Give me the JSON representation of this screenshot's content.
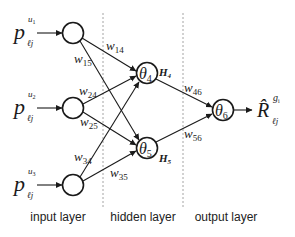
{
  "diagram": {
    "type": "neural-network",
    "inputs": [
      {
        "id": "input-1",
        "symbol": "p",
        "superscript": "u",
        "superscript_sub": "1",
        "subscript": "ℓj"
      },
      {
        "id": "input-2",
        "symbol": "p",
        "superscript": "u",
        "superscript_sub": "2",
        "subscript": "ℓj"
      },
      {
        "id": "input-3",
        "symbol": "p",
        "superscript": "u",
        "superscript_sub": "3",
        "subscript": "ℓj"
      }
    ],
    "hidden": [
      {
        "id": "hidden-4",
        "theta": "θ",
        "theta_sub": "4",
        "output": "H",
        "output_sub": "4"
      },
      {
        "id": "hidden-5",
        "theta": "θ",
        "theta_sub": "5",
        "output": "H",
        "output_sub": "5"
      }
    ],
    "output_node": {
      "theta": "θ",
      "theta_sub": "6"
    },
    "output_label": {
      "symbol": "R̂",
      "superscript": "g",
      "superscript_sub": "i",
      "subscript": "ℓj"
    },
    "weights": [
      {
        "name": "w",
        "sub": "14",
        "from": 1,
        "to": 4
      },
      {
        "name": "w",
        "sub": "15",
        "from": 1,
        "to": 5
      },
      {
        "name": "w",
        "sub": "24",
        "from": 2,
        "to": 4
      },
      {
        "name": "w",
        "sub": "25",
        "from": 2,
        "to": 5
      },
      {
        "name": "w",
        "sub": "34",
        "from": 3,
        "to": 4
      },
      {
        "name": "w",
        "sub": "35",
        "from": 3,
        "to": 5
      },
      {
        "name": "w",
        "sub": "46",
        "from": 4,
        "to": 6
      },
      {
        "name": "w",
        "sub": "56",
        "from": 5,
        "to": 6
      }
    ],
    "layers": {
      "input": "input layer",
      "hidden": "hidden layer",
      "output": "output layer"
    },
    "colors": {
      "stroke": "#1a1a1a",
      "divider": "#9a9a9a",
      "background": "#ffffff"
    }
  }
}
